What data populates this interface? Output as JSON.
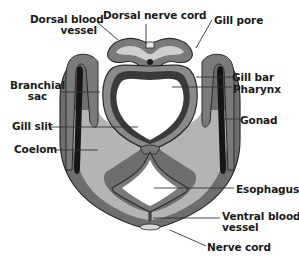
{
  "figure": {
    "colors": {
      "background": "#ffffff",
      "body_wall": "#6e6e6e",
      "body_wall_edge": "#2b2b2b",
      "coelom": "#b4b4b4",
      "pharynx_wall": "#8a8a8a",
      "pharynx_lining": "#d0d0d0",
      "gonad": "#151515",
      "lumen": "#ffffff",
      "label_text": "#1a1a1a"
    },
    "labels": {
      "dorsal_blood_vessel_line1": "Dorsal blood",
      "dorsal_blood_vessel_line2": "vessel",
      "dorsal_nerve_cord": "Dorsal nerve cord",
      "gill_pore": "Gill pore",
      "branchial_sac_line1": "Branchial",
      "branchial_sac_line2": "sac",
      "gill_bar": "Gill bar",
      "pharynx": "Pharynx",
      "gill_slit": "Gill slit",
      "gonad": "Gonad",
      "coelom": "Coelom",
      "esophagus": "Esophagus",
      "ventral_blood_vessel_line1": "Ventral blood",
      "ventral_blood_vessel_line2": "vessel",
      "nerve_cord": "Nerve cord"
    }
  }
}
